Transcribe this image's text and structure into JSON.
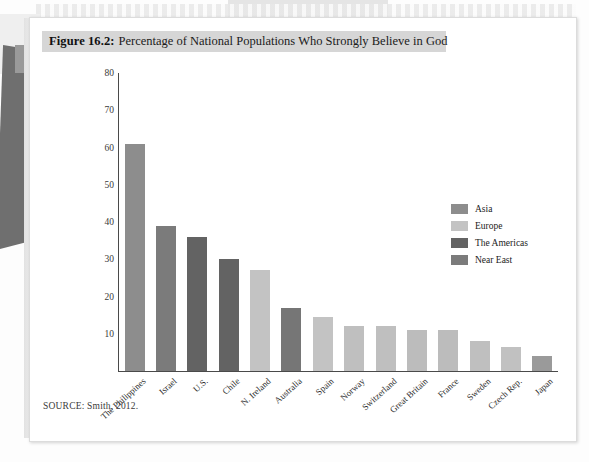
{
  "figure": {
    "label": "Figure 16.2:",
    "title": "Percentage of National Populations Who Strongly Believe in God",
    "source": "SOURCE: Smith, 2012."
  },
  "legend": {
    "position": "right-inside",
    "items": [
      {
        "label": "Asia",
        "color": "#8d8d8d"
      },
      {
        "label": "Europe",
        "color": "#c3c3c3"
      },
      {
        "label": "The Americas",
        "color": "#636363"
      },
      {
        "label": "Near East",
        "color": "#7b7b7b"
      }
    ]
  },
  "chart_data": {
    "type": "bar",
    "title": "Percentage of National Populations Who Strongly Believe in God",
    "xlabel": "",
    "ylabel": "",
    "ylim": [
      0,
      80
    ],
    "yticks": [
      10,
      20,
      30,
      40,
      50,
      60,
      70,
      80
    ],
    "grid": false,
    "categories": [
      "The Philippines",
      "Israel",
      "U.S.",
      "Chile",
      "N. Ireland",
      "Australia",
      "Spain",
      "Norway",
      "Switzerland",
      "Great Britain",
      "France",
      "Sweden",
      "Czech Rep.",
      "Japan"
    ],
    "values": [
      61,
      39,
      36,
      30,
      27,
      17,
      14.5,
      12,
      12,
      11,
      11,
      8,
      6.5,
      4
    ],
    "groups": [
      "Asia",
      "Near East",
      "The Americas",
      "The Americas",
      "Europe",
      "The Americas",
      "Europe",
      "Europe",
      "Europe",
      "Europe",
      "Europe",
      "Europe",
      "Europe",
      "Asia"
    ],
    "colors": [
      "#8d8d8d",
      "#7b7b7b",
      "#636363",
      "#636363",
      "#c3c3c3",
      "#767676",
      "#c3c3c3",
      "#bfbfbf",
      "#bfbfbf",
      "#bcbcbc",
      "#bcbcbc",
      "#bfbfbf",
      "#c1c1c1",
      "#9a9a9a"
    ]
  }
}
